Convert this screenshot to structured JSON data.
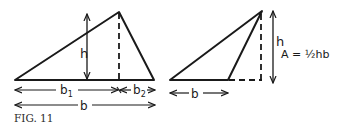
{
  "figure": {
    "caption": "FIG. 11",
    "left_panel": {
      "height_label": "h",
      "base1_label": "b",
      "base1_sub": "1",
      "base2_label": "b",
      "base2_sub": "2",
      "total_base_label": "b"
    },
    "right_panel": {
      "height_label": "h",
      "base_label": "b",
      "formula_prefix": "A = ",
      "formula_fraction": "½",
      "formula_suffix": "hb"
    }
  },
  "colors": {
    "stroke": "#1a1a1a",
    "background": "#ffffff"
  }
}
